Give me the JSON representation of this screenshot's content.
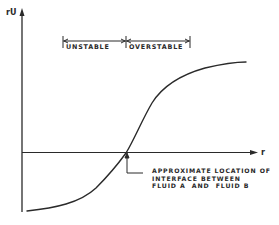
{
  "diagram": {
    "y_axis_label": "rU",
    "x_axis_label": "r",
    "ranges": [
      {
        "label": "UNSTABLE",
        "from": "left",
        "to": "interface"
      },
      {
        "label": "OVERSTABLE",
        "from": "interface",
        "to": "right"
      }
    ],
    "annotation": {
      "lines": [
        "APPROXIMATE LOCATION OF",
        "INTERFACE BETWEEN",
        "FLUID A  AND  FLUID B"
      ]
    },
    "curve": {
      "description": "Monotonically increasing S-shaped curve of rU versus r, crossing the r-axis at the interface between fluid A and fluid B",
      "shape": "sigmoid"
    },
    "colors": {
      "ink": "#2a2a2a",
      "background": "#ffffff"
    }
  }
}
